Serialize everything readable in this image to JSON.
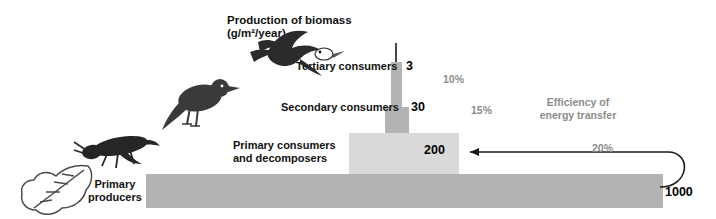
{
  "diagram": {
    "title_line1": "Production of biomass",
    "title_line2": "(g/m²/year)",
    "tiers": [
      {
        "label": "Tertiary consumers",
        "value": "3",
        "percent": "10%"
      },
      {
        "label": "Secondary consumers",
        "value": "30",
        "percent": "15%"
      },
      {
        "label_line1": "Primary consumers",
        "label_line2": "and decomposers",
        "value": "200",
        "percent": "20%"
      },
      {
        "label_line1": "Primary",
        "label_line2": "producers",
        "value": "1000",
        "percent": ""
      }
    ],
    "efficiency_line1": "Efficiency of",
    "efficiency_line2": "energy transfer",
    "colors": {
      "bar_dark": "#b3b3b3",
      "bar_light": "#d9d9d9",
      "grey_text": "#8c8c8c",
      "black_text": "#111111"
    },
    "organisms": [
      {
        "name": "magpie-bird-icon"
      },
      {
        "name": "songbird-icon"
      },
      {
        "name": "grasshopper-insect-icon"
      },
      {
        "name": "oak-leaf-icon"
      }
    ]
  }
}
